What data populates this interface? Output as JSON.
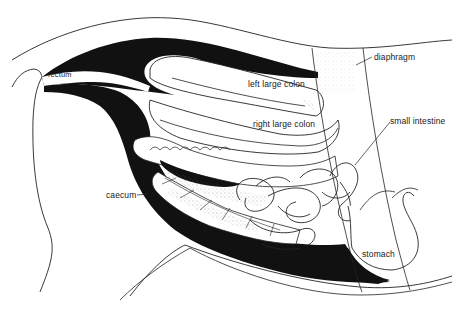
{
  "figure": {
    "colors": {
      "ink": "#111111",
      "paper": "#ffffff",
      "stipple": "#555555"
    }
  },
  "labels": {
    "rectum": "rectum",
    "left_large_colon": "left large colon",
    "right_large_colon": "right large colon",
    "diaphragm": "diaphragm",
    "small_intestine": "small intestine",
    "caecum": "caecum",
    "stomach": "stomach"
  }
}
